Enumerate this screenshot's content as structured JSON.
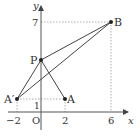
{
  "diagram": {
    "type": "coordinate-geometry",
    "axes": {
      "x_label": "x",
      "y_label": "y",
      "origin_label": "O"
    },
    "ticks": {
      "x": [
        "−2",
        "2",
        "6"
      ],
      "y": [
        "1",
        "7"
      ]
    },
    "points": [
      {
        "name": "A",
        "label": "A",
        "x": 2,
        "y": 1
      },
      {
        "name": "A'",
        "label": "A′",
        "x": -2,
        "y": 1
      },
      {
        "name": "B",
        "label": "B",
        "x": 6,
        "y": 7
      },
      {
        "name": "P",
        "label": "P",
        "x": 0,
        "y": 4.33
      }
    ],
    "segments": [
      [
        "A'",
        "B"
      ],
      [
        "P",
        "B"
      ],
      [
        "A'",
        "P"
      ],
      [
        "P",
        "A"
      ]
    ],
    "colors": {
      "line": "#444444",
      "axis": "#555555",
      "guide": "#999999"
    }
  }
}
